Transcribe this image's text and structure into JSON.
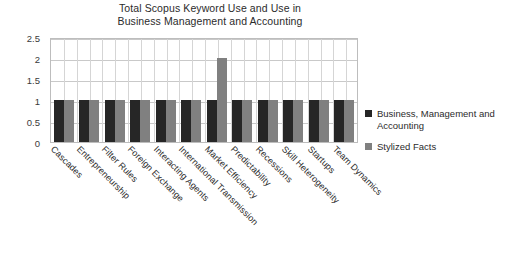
{
  "chart_data": {
    "type": "bar",
    "title": "Total Scopus Keyword Use and Use in Business Management and Accounting",
    "title_lines": [
      "Total Scopus Keyword Use and Use in",
      "Business Management and Accounting"
    ],
    "xlabel": "",
    "ylabel": "",
    "ylim": [
      0,
      2.5
    ],
    "ytick_labels": [
      "2.5",
      "2",
      "1.5",
      "1",
      "0.5",
      "0"
    ],
    "ytick_values": [
      2.5,
      2,
      1.5,
      1,
      0.5,
      0
    ],
    "grid": true,
    "legend_position": "right",
    "categories": [
      "Cascades",
      "Entrepreneurship",
      "Filter Rules",
      "Foreign Exchange",
      "Interacting Agents",
      "International Transmission",
      "Market Efficiency",
      "Predictability",
      "Recessions",
      "Skill Heterogeneity",
      "Startups",
      "Team Dynamics"
    ],
    "series": [
      {
        "name": "Business, Management and Accounting",
        "color": "#262626",
        "values": [
          1,
          1,
          1,
          1,
          1,
          1,
          1,
          1,
          1,
          1,
          1,
          1
        ]
      },
      {
        "name": "Stylized Facts",
        "color": "#808080",
        "values": [
          1,
          1,
          1,
          1,
          1,
          1,
          2,
          1,
          1,
          1,
          1,
          1
        ]
      }
    ]
  },
  "legend": {
    "items": [
      {
        "label": "Business, Management and Accounting",
        "color": "#262626"
      },
      {
        "label": "Stylized Facts",
        "color": "#808080"
      }
    ]
  }
}
